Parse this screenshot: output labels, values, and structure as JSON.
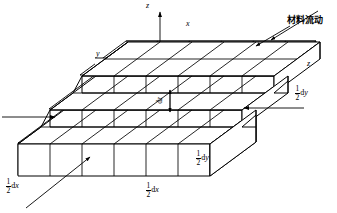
{
  "figure": {
    "type": "isometric-stepped-block-diagram",
    "stroke_color": "#000000",
    "fill_color": "#ffffff",
    "background": "#ffffff"
  },
  "axes": [
    {
      "name": "z-axis",
      "label": "z",
      "orientation": "vertical-up",
      "x": 146,
      "y": 3
    },
    {
      "name": "x-axis",
      "label": "x",
      "orientation": "upper-right-edge",
      "x": 186,
      "y": 24
    },
    {
      "name": "y-axis",
      "label": "y",
      "orientation": "upper-left-edge",
      "x": 96,
      "y": 53
    },
    {
      "name": "z-depth",
      "label": "z",
      "orientation": "right-side-height",
      "x": 307,
      "y": 63
    }
  ],
  "annotations": {
    "material_flow": {
      "text": "材料流动",
      "x": 287,
      "y": 20
    }
  },
  "dimensions": [
    {
      "name": "half-dx-left",
      "numerator": "1",
      "denominator": "2",
      "unit": "d",
      "variable": "x",
      "x": 8,
      "y": 182
    },
    {
      "name": "half-dx-bottom",
      "numerator": "1",
      "denominator": "2",
      "unit": "d",
      "variable": "x",
      "x": 148,
      "y": 186
    },
    {
      "name": "half-dy-center",
      "numerator": "1",
      "denominator": "2",
      "unit": "d",
      "variable": "y",
      "x": 197,
      "y": 155
    },
    {
      "name": "half-dy-right",
      "numerator": "1",
      "denominator": "2",
      "unit": "d",
      "variable": "y",
      "x": 296,
      "y": 90
    }
  ],
  "thickness_label": {
    "name": "dz",
    "unit": "d",
    "variable": "z",
    "x": 162,
    "y": 102
  },
  "arrows": [
    {
      "name": "flow-arrow-left",
      "x1": 2,
      "y1": 117,
      "x2": 57,
      "y2": 117
    },
    {
      "name": "flow-arrow-right",
      "x1": 304,
      "y1": 108,
      "x2": 242,
      "y2": 108
    },
    {
      "name": "callout-arrow-upper",
      "x1": 317,
      "y1": 12,
      "x2": 272,
      "y2": 40
    },
    {
      "name": "callout-arrow-lower",
      "x1": 289,
      "y1": 27,
      "x2": 255,
      "y2": 47
    },
    {
      "name": "callout-arrow-dx",
      "x1": 28,
      "y1": 207,
      "x2": 90,
      "y2": 158
    }
  ]
}
